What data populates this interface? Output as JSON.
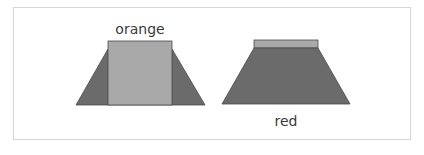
{
  "figure": {
    "colors": {
      "frame_border": "#d6d6d6",
      "dark_fill": "#6b6b6b",
      "light_fill": "#a9a9a9",
      "outline": "#4a4a4a",
      "text": "#3a3a3a"
    },
    "shapes": [
      {
        "id": "left",
        "label": "orange",
        "label_position": "above",
        "description": "trapezoid with large light rectangle overlaid in center"
      },
      {
        "id": "right",
        "label": "red",
        "label_position": "below",
        "description": "dark trapezoid with thin light strip on top"
      }
    ]
  }
}
